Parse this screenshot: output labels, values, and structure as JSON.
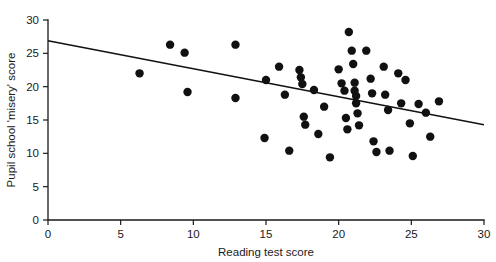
{
  "chart_data": {
    "type": "scatter",
    "title": "",
    "xlabel": "Reading test score",
    "ylabel": "Pupil school 'misery' score",
    "xlim": [
      0,
      30
    ],
    "ylim": [
      0,
      30
    ],
    "xticks": [
      0,
      5,
      10,
      15,
      20,
      25,
      30
    ],
    "yticks": [
      0,
      5,
      10,
      15,
      20,
      25,
      30
    ],
    "xtick_labels": [
      "0",
      "5",
      "10",
      "15",
      "20",
      "25",
      "30"
    ],
    "ytick_labels": [
      "0",
      "5",
      "10",
      "15",
      "20",
      "25",
      "30"
    ],
    "grid": false,
    "legend": null,
    "legend_position": "none",
    "marker": "filled-circle",
    "marker_color": "#111111",
    "marker_size": 4.2,
    "trend_line": {
      "label": "least squares regression line",
      "color": "#111111",
      "x_start": 0,
      "y_start": 26.9,
      "x_end": 30,
      "y_end": 14.3,
      "slope": -0.42,
      "intercept": 26.9
    },
    "points": [
      {
        "x": 6.3,
        "y": 22.0
      },
      {
        "x": 8.4,
        "y": 26.3
      },
      {
        "x": 9.4,
        "y": 25.1
      },
      {
        "x": 9.6,
        "y": 19.2
      },
      {
        "x": 12.9,
        "y": 26.3
      },
      {
        "x": 12.9,
        "y": 18.3
      },
      {
        "x": 14.9,
        "y": 12.3
      },
      {
        "x": 15.0,
        "y": 21.0
      },
      {
        "x": 15.9,
        "y": 23.0
      },
      {
        "x": 16.3,
        "y": 18.8
      },
      {
        "x": 16.6,
        "y": 10.4
      },
      {
        "x": 17.3,
        "y": 22.5
      },
      {
        "x": 17.4,
        "y": 21.4
      },
      {
        "x": 17.5,
        "y": 20.4
      },
      {
        "x": 17.6,
        "y": 15.5
      },
      {
        "x": 17.7,
        "y": 14.3
      },
      {
        "x": 18.3,
        "y": 19.5
      },
      {
        "x": 18.6,
        "y": 12.9
      },
      {
        "x": 19.0,
        "y": 17.0
      },
      {
        "x": 19.4,
        "y": 9.4
      },
      {
        "x": 20.0,
        "y": 22.6
      },
      {
        "x": 20.2,
        "y": 20.5
      },
      {
        "x": 20.4,
        "y": 19.4
      },
      {
        "x": 20.5,
        "y": 15.3
      },
      {
        "x": 20.6,
        "y": 13.6
      },
      {
        "x": 20.7,
        "y": 28.2
      },
      {
        "x": 20.9,
        "y": 25.4
      },
      {
        "x": 21.0,
        "y": 23.4
      },
      {
        "x": 21.1,
        "y": 20.6
      },
      {
        "x": 21.1,
        "y": 19.4
      },
      {
        "x": 21.2,
        "y": 18.6
      },
      {
        "x": 21.2,
        "y": 17.5
      },
      {
        "x": 21.3,
        "y": 16.0
      },
      {
        "x": 21.4,
        "y": 14.2
      },
      {
        "x": 21.9,
        "y": 25.4
      },
      {
        "x": 22.2,
        "y": 21.2
      },
      {
        "x": 22.3,
        "y": 19.0
      },
      {
        "x": 22.4,
        "y": 11.8
      },
      {
        "x": 22.6,
        "y": 10.2
      },
      {
        "x": 23.1,
        "y": 23.0
      },
      {
        "x": 23.2,
        "y": 18.8
      },
      {
        "x": 23.4,
        "y": 16.5
      },
      {
        "x": 23.5,
        "y": 10.4
      },
      {
        "x": 24.1,
        "y": 22.0
      },
      {
        "x": 24.3,
        "y": 17.5
      },
      {
        "x": 24.6,
        "y": 21.0
      },
      {
        "x": 24.9,
        "y": 14.5
      },
      {
        "x": 25.1,
        "y": 9.6
      },
      {
        "x": 25.5,
        "y": 17.4
      },
      {
        "x": 26.0,
        "y": 16.1
      },
      {
        "x": 26.3,
        "y": 12.5
      },
      {
        "x": 26.9,
        "y": 17.8
      }
    ]
  }
}
